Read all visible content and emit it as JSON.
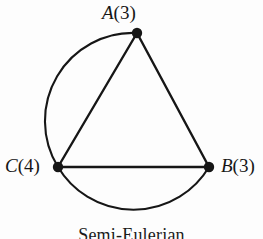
{
  "figure": {
    "caption": "Semi-Eulerian",
    "background_color": "#fdfdfd",
    "stroke_color": "#161616"
  },
  "graph": {
    "vertices": [
      {
        "id": "A",
        "name": "A",
        "degree": "(3)",
        "label": "A(3)",
        "x": 137,
        "y": 33,
        "dot_radius": 5
      },
      {
        "id": "C",
        "name": "C",
        "degree": "(4)",
        "label": "C(4)",
        "x": 58,
        "y": 167,
        "dot_radius": 5
      },
      {
        "id": "B",
        "name": "B",
        "degree": "(3)",
        "label": "B(3)",
        "x": 209,
        "y": 167,
        "dot_radius": 5
      }
    ],
    "edges": [
      {
        "id": "edge-a-b",
        "from": "A",
        "to": "B",
        "shape": "straight"
      },
      {
        "id": "edge-a-c",
        "from": "A",
        "to": "C",
        "shape": "straight"
      },
      {
        "id": "edge-c-b",
        "from": "C",
        "to": "B",
        "shape": "straight"
      },
      {
        "id": "edge-a-c-arc",
        "from": "A",
        "to": "C",
        "shape": "arc-left"
      },
      {
        "id": "edge-c-b-arc",
        "from": "C",
        "to": "B",
        "shape": "arc-bottom"
      }
    ]
  }
}
